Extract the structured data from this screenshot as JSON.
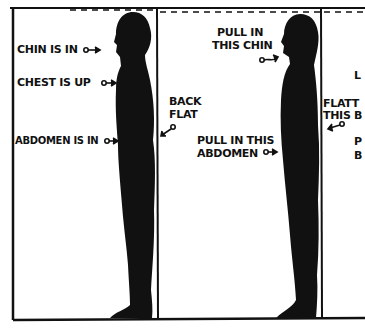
{
  "figure": {
    "panel_left": {
      "labels": {
        "chin": "CHIN IS IN",
        "chest": "CHEST IS UP",
        "abdomen": "ABDOMEN IS IN",
        "back_line1": "BACK",
        "back_line2": "FLAT"
      }
    },
    "panel_middle": {
      "labels": {
        "chin_line1": "PULL IN",
        "chin_line2": "THIS CHIN",
        "abdomen_line1": "PULL IN THIS",
        "abdomen_line2": "ABDOMEN"
      }
    },
    "panel_right_partial": {
      "labels": {
        "top": "L",
        "flatten_line1": "FLATT",
        "flatten_line2": "THIS B",
        "bottom_line1": "P",
        "bottom_line2": "B"
      }
    },
    "colors": {
      "ink": "#111111",
      "background": "#ffffff"
    }
  }
}
